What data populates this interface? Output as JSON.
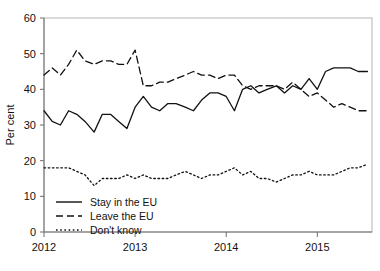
{
  "chart_data": {
    "type": "line",
    "title": "",
    "xlabel": "",
    "ylabel": "Per cent",
    "ylim": [
      0,
      60
    ],
    "yticks": [
      0,
      10,
      20,
      30,
      40,
      50,
      60
    ],
    "xticks": [
      2012,
      2013,
      2014,
      2015
    ],
    "xtick_labels": [
      "2012",
      "2013",
      "2014",
      "2015"
    ],
    "xlim": [
      2012.0,
      2015.6
    ],
    "grid": false,
    "legend_position": "bottom-left",
    "x": [
      2012.0,
      2012.09,
      2012.18,
      2012.27,
      2012.36,
      2012.45,
      2012.55,
      2012.64,
      2012.73,
      2012.82,
      2012.91,
      2013.0,
      2013.09,
      2013.18,
      2013.27,
      2013.36,
      2013.45,
      2013.55,
      2013.64,
      2013.73,
      2013.82,
      2013.91,
      2014.0,
      2014.09,
      2014.18,
      2014.27,
      2014.36,
      2014.45,
      2014.55,
      2014.64,
      2014.73,
      2014.82,
      2014.91,
      2015.0,
      2015.09,
      2015.18,
      2015.27,
      2015.36,
      2015.45,
      2015.55
    ],
    "series": [
      {
        "name": "Stay in the EU",
        "style": "solid",
        "values": [
          34,
          31,
          30,
          34,
          33,
          31,
          28,
          33,
          33,
          31,
          29,
          35,
          38,
          35,
          34,
          36,
          36,
          35,
          34,
          37,
          39,
          39,
          38,
          34,
          40,
          41,
          39,
          40,
          41,
          39,
          41,
          40,
          43,
          40,
          45,
          46,
          46,
          46,
          45,
          45
        ]
      },
      {
        "name": "Leave the EU",
        "style": "dashed",
        "values": [
          44,
          46,
          44,
          47,
          51,
          48,
          47,
          48,
          48,
          47,
          47,
          51,
          41,
          41,
          42,
          42,
          43,
          44,
          45,
          44,
          44,
          43,
          44,
          44,
          41,
          40,
          41,
          41,
          41,
          40,
          42,
          40,
          38,
          39,
          37,
          35,
          36,
          35,
          34,
          34
        ]
      },
      {
        "name": "Don't know",
        "style": "dotted",
        "values": [
          18,
          18,
          18,
          18,
          17,
          16,
          13,
          15,
          15,
          15,
          16,
          15,
          16,
          15,
          15,
          15,
          16,
          17,
          16,
          15,
          16,
          16,
          17,
          18,
          16,
          17,
          15,
          15,
          14,
          15,
          16,
          16,
          17,
          16,
          16,
          16,
          17,
          18,
          18,
          19
        ]
      }
    ]
  },
  "legend": {
    "items": [
      {
        "label": "Stay in the EU",
        "style": "solid"
      },
      {
        "label": "Leave the EU",
        "style": "dashed"
      },
      {
        "label": "Don't know",
        "style": "dotted"
      }
    ]
  }
}
